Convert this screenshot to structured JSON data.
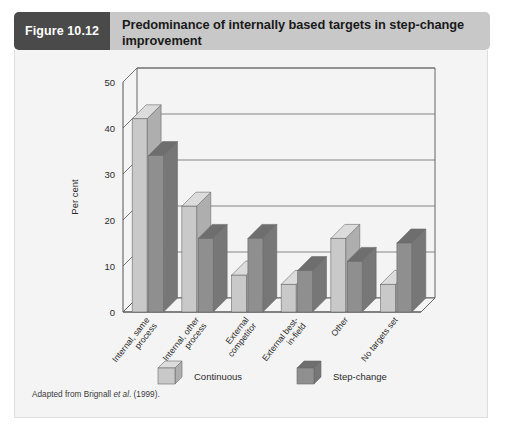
{
  "figure": {
    "tag": "Figure 10.12",
    "title": "Predominance of internally based targets in step-change improvement",
    "footnote_prefix": "Adapted from Brignall ",
    "footnote_italic": "et al",
    "footnote_suffix": ". (1999)."
  },
  "colors": {
    "header_band": "#c8c8c8",
    "tag_background": "#4a4a4a",
    "tag_text": "#ffffff",
    "panel_background": "#f4f4f4",
    "continuous_front": "#c9c9c9",
    "continuous_top": "#dcdcdc",
    "continuous_side": "#aeaeae",
    "stepchange_front": "#8f8f8f",
    "stepchange_top": "#6e6e6e",
    "stepchange_side": "#777777",
    "axis": "#555555",
    "gridline": "#6a6a6a"
  },
  "chart_data": {
    "type": "bar",
    "title": "",
    "xlabel": "",
    "ylabel": "Per cent",
    "ylim": [
      0,
      50
    ],
    "yticks": [
      0,
      10,
      20,
      30,
      40,
      50
    ],
    "ytick_labels": [
      "0",
      "10",
      "20",
      "30",
      "40",
      "50"
    ],
    "grid": true,
    "legend_position": "bottom",
    "categories": [
      "Internal, same process",
      "Internal, other process",
      "External competitor",
      "External best-in-field",
      "Other",
      "No targets set"
    ],
    "series": [
      {
        "name": "Continuous",
        "values": [
          42,
          23,
          8,
          6,
          16,
          6
        ]
      },
      {
        "name": "Step-change",
        "values": [
          34,
          16,
          16,
          9,
          11,
          15
        ]
      }
    ]
  }
}
